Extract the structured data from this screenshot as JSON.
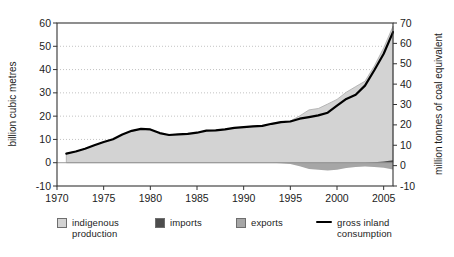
{
  "chart_data": {
    "type": "area",
    "title": "",
    "x_axis": {
      "min": 1970,
      "max": 2006,
      "ticks": [
        1970,
        1975,
        1980,
        1985,
        1990,
        1995,
        2000,
        2005
      ]
    },
    "left_axis": {
      "title": "billion cubic metres",
      "min": -10,
      "max": 60,
      "ticks": [
        -10,
        0,
        10,
        20,
        30,
        40,
        50,
        60
      ]
    },
    "right_axis": {
      "title": "million tonnes of coal equivalent",
      "min": -10,
      "max": 70,
      "ticks": [
        -10,
        0,
        10,
        20,
        30,
        40,
        50,
        60,
        70
      ]
    },
    "gridlines": [
      10,
      20,
      30,
      40,
      50
    ],
    "x": [
      1971,
      1972,
      1973,
      1974,
      1975,
      1976,
      1977,
      1978,
      1979,
      1980,
      1981,
      1982,
      1983,
      1984,
      1985,
      1986,
      1987,
      1988,
      1989,
      1990,
      1991,
      1992,
      1993,
      1994,
      1995,
      1996,
      1997,
      1998,
      1999,
      2000,
      2001,
      2002,
      2003,
      2004,
      2005,
      2006
    ],
    "series": [
      {
        "name": "indigenous production",
        "role": "area-positive",
        "color": "#d3d3d3",
        "edge": "#a9a9a9",
        "values": [
          3.9,
          4.8,
          6.0,
          7.5,
          8.9,
          10.1,
          12.1,
          13.7,
          14.5,
          14.3,
          12.7,
          11.9,
          12.2,
          12.4,
          12.9,
          13.8,
          13.9,
          14.3,
          15.0,
          15.3,
          15.7,
          15.8,
          16.8,
          17.6,
          17.9,
          20.1,
          22.7,
          23.3,
          25.2,
          27.2,
          30.3,
          32.7,
          35.0,
          41.5,
          49.3,
          58.6
        ]
      },
      {
        "name": "imports",
        "role": "area-positive",
        "color": "#4d4d4d",
        "edge": "none",
        "values": [
          0,
          0,
          0,
          0,
          0,
          0,
          0,
          0,
          0,
          0,
          0,
          0,
          0,
          0,
          0,
          0,
          0,
          0,
          0,
          0,
          0,
          0,
          0,
          0,
          0,
          0,
          0,
          0,
          0,
          0,
          0,
          0,
          0,
          0.2,
          0.5,
          1.1
        ]
      },
      {
        "name": "exports",
        "role": "area-negative",
        "color": "#a6a6a6",
        "edge": "none",
        "values": [
          0,
          0,
          0,
          0,
          0,
          0,
          0,
          0,
          0,
          0,
          0,
          0,
          0,
          0,
          0,
          0,
          0,
          0,
          0,
          0,
          0,
          0,
          0,
          0.2,
          0.5,
          1.5,
          2.7,
          3.0,
          3.3,
          3.0,
          2.3,
          1.8,
          1.6,
          1.8,
          2.2,
          2.9
        ]
      },
      {
        "name": "gross inland consumption",
        "role": "line",
        "color": "#000000",
        "values": [
          3.9,
          4.8,
          6.0,
          7.5,
          8.9,
          10.1,
          12.1,
          13.7,
          14.5,
          14.3,
          12.7,
          11.9,
          12.2,
          12.4,
          12.9,
          13.8,
          13.9,
          14.3,
          15.0,
          15.3,
          15.6,
          15.8,
          16.7,
          17.4,
          17.7,
          18.9,
          19.6,
          20.3,
          21.5,
          24.5,
          27.4,
          29.2,
          33.1,
          39.7,
          46.8,
          56.1
        ]
      }
    ],
    "colors": {
      "grid": "#c3c3c3",
      "frame": "#333333",
      "zero_line": "#8f8f8f",
      "tick_text": "#1c1c1c"
    }
  },
  "legend": {
    "items": [
      {
        "label": "indigenous production",
        "type": "box",
        "color": "#d3d3d3"
      },
      {
        "label": "imports",
        "type": "box",
        "color": "#4d4d4d"
      },
      {
        "label": "exports",
        "type": "box",
        "color": "#a6a6a6"
      },
      {
        "label": "gross inland consumption",
        "type": "line",
        "color": "#000000"
      }
    ]
  }
}
